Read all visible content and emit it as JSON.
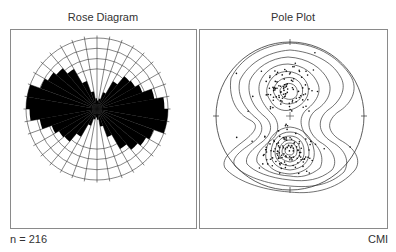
{
  "figure": {
    "left_panel": {
      "title": "Rose Diagram"
    },
    "right_panel": {
      "title": "Pole Plot"
    },
    "footer_left": "n = 216",
    "footer_right": "CMI"
  },
  "chart_data": [
    {
      "type": "rose",
      "title": "Rose Diagram",
      "sector_width_deg": 10,
      "symmetry": "bidirectional (axial)",
      "rings": 4,
      "n": 216,
      "sector_start_deg": [
        0,
        10,
        20,
        30,
        40,
        50,
        60,
        70,
        80,
        90,
        100,
        110,
        120,
        130,
        140,
        150,
        160,
        170
      ],
      "relative_length": [
        0.12,
        0.15,
        0.25,
        0.45,
        0.6,
        0.62,
        0.68,
        0.82,
        0.95,
        1.0,
        1.0,
        0.85,
        0.8,
        0.75,
        0.65,
        0.42,
        0.25,
        0.15
      ],
      "fill_color": "#000000"
    },
    {
      "type": "scatter",
      "title": "Pole Plot",
      "projection": "equal-area lower hemisphere (stereonet)",
      "contoured": true,
      "clusters": [
        {
          "name": "upper cluster",
          "center_xy_norm": [
            0.0,
            -0.45
          ],
          "trend": "NNE-SSW elongated"
        },
        {
          "name": "lower cluster",
          "center_xy_norm": [
            0.0,
            0.45
          ],
          "trend": "N-S elongated, densest"
        }
      ],
      "n": 216
    }
  ]
}
